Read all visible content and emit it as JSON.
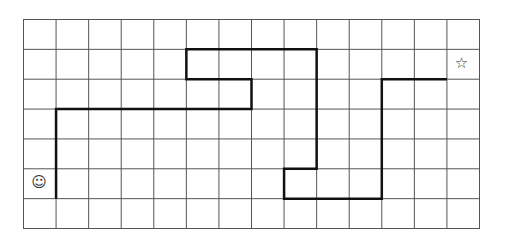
{
  "grid": {
    "columns": 14,
    "rows": 7,
    "line_color": "#555555",
    "path_color": "#111111"
  },
  "path": {
    "points": [
      [
        1,
        6
      ],
      [
        1,
        3
      ],
      [
        7,
        3
      ],
      [
        7,
        2
      ],
      [
        5,
        2
      ],
      [
        5,
        1
      ],
      [
        9,
        1
      ],
      [
        9,
        5
      ],
      [
        8,
        5
      ],
      [
        8,
        6
      ],
      [
        11,
        6
      ],
      [
        11,
        2
      ],
      [
        13,
        2
      ]
    ]
  },
  "start_marker": {
    "icon": "smiley-face-icon",
    "glyph": "☺",
    "cell": [
      0,
      5
    ]
  },
  "end_marker": {
    "icon": "star-icon",
    "glyph": "☆",
    "cell": [
      13,
      1
    ]
  }
}
